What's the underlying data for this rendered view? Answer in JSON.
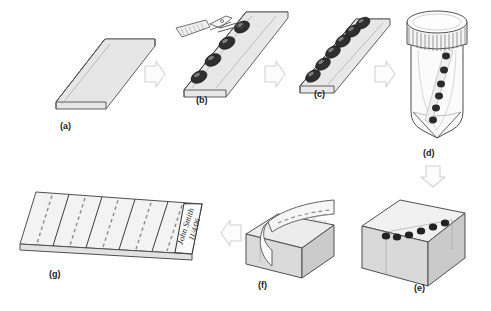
{
  "figure": {
    "background_color": "#ffffff",
    "caption": ""
  },
  "style": {
    "outline_color": "#555555",
    "fill_light": "#f2f2f2",
    "fill_mid": "#dcdcdc",
    "fill_dark": "#c6c6c6",
    "bead_color": "#2b2b2b",
    "bead_highlight": "#7a7a7a",
    "arrow_stroke": "#cfcfcf",
    "arrow_fill": "#fbfbfb",
    "label_color": "#222222",
    "dash_color": "#8c8c8c"
  },
  "panels": [
    {
      "id": "a",
      "label": "(a)",
      "name": "blank-strip",
      "description": "Empty flat gel strip / support shown in oblique view",
      "bead_count": 0
    },
    {
      "id": "b",
      "label": "(b)",
      "name": "loading-beads-with-forceps",
      "description": "Forceps with knurled handle placing beads onto the strip",
      "bead_count": 4,
      "tool": "forceps"
    },
    {
      "id": "c",
      "label": "(c)",
      "name": "loaded-strip",
      "description": "Strip with a full row of beads arranged along its length",
      "bead_count": 6
    },
    {
      "id": "d",
      "label": "(d)",
      "name": "capped-tube",
      "description": "Screw-cap conical tube containing the loaded strip in fixative",
      "bead_count": 6,
      "vessel": "conical-tube"
    },
    {
      "id": "e",
      "label": "(e)",
      "name": "embedded-block",
      "description": "Paraffin block with the bead row embedded near the surface",
      "bead_count": 6
    },
    {
      "id": "f",
      "label": "(f)",
      "name": "sectioning-block",
      "description": "Block being microtome-sectioned, ribbon curling off the face",
      "bead_count": 0
    },
    {
      "id": "g",
      "label": "(g)",
      "name": "labelled-slide",
      "description": "Glass slide bearing five sections, each a dashed row of cut beads, with a frosted handwritten label",
      "section_count": 5,
      "slide_label_text": "John Smith",
      "slide_label_date": "11/4/06"
    }
  ],
  "arrows": [
    {
      "name": "arrow-a-to-b",
      "from": "a",
      "to": "b",
      "direction": "right"
    },
    {
      "name": "arrow-b-to-c",
      "from": "b",
      "to": "c",
      "direction": "right"
    },
    {
      "name": "arrow-c-to-d",
      "from": "c",
      "to": "d",
      "direction": "right"
    },
    {
      "name": "arrow-d-to-e",
      "from": "d",
      "to": "e",
      "direction": "down"
    },
    {
      "name": "arrow-e-to-f",
      "from": "e",
      "to": "f",
      "direction": "left"
    },
    {
      "name": "arrow-f-to-g",
      "from": "f",
      "to": "g",
      "direction": "left"
    }
  ]
}
